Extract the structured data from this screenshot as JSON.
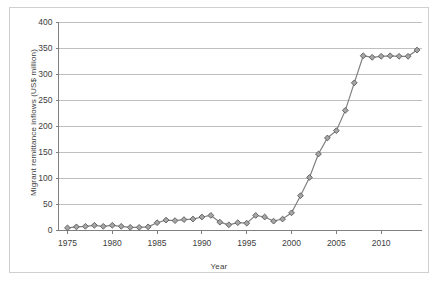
{
  "chart_data": {
    "type": "line",
    "title": "",
    "subtitle": "",
    "xlabel": "Year",
    "ylabel": "Migrant remittance inflows (US$ million)",
    "xlim": [
      1974,
      2014.5
    ],
    "ylim": [
      0,
      400
    ],
    "ytick_labels": [
      "0",
      "50",
      "100",
      "150",
      "200",
      "250",
      "300",
      "350",
      "400"
    ],
    "ytick_values": [
      0,
      50,
      100,
      150,
      200,
      250,
      300,
      350,
      400
    ],
    "xtick_labels": [
      "1975",
      "1980",
      "1985",
      "1990",
      "1995",
      "2000",
      "2005",
      "2010"
    ],
    "xtick_values": [
      1975,
      1980,
      1985,
      1990,
      1995,
      2000,
      2005,
      2010
    ],
    "grid": "horizontal",
    "legend": "none",
    "marker": "diamond",
    "series_color": "#808080",
    "marker_fill": "#a6a6a6",
    "marker_stroke": "#595959",
    "grid_color": "#bfbfbf",
    "axis_color": "#808080",
    "text_color": "#404040",
    "background": "#ffffff",
    "x": [
      1975,
      1976,
      1977,
      1978,
      1979,
      1980,
      1981,
      1982,
      1983,
      1984,
      1985,
      1986,
      1987,
      1988,
      1989,
      1990,
      1991,
      1992,
      1993,
      1994,
      1995,
      1996,
      1997,
      1998,
      1999,
      2000,
      2001,
      2002,
      2003,
      2004,
      2005,
      2006,
      2007,
      2008,
      2009,
      2010,
      2011,
      2012,
      2013,
      2014
    ],
    "values": [
      5,
      7,
      8,
      10,
      8,
      10,
      8,
      6,
      6,
      7,
      15,
      20,
      19,
      21,
      22,
      26,
      29,
      16,
      11,
      15,
      14,
      29,
      26,
      18,
      22,
      34,
      67,
      102,
      147,
      178,
      192,
      231,
      284,
      336,
      333,
      335,
      336,
      335,
      335,
      347
    ],
    "series": [
      {
        "name": "Migrant remittance inflows",
        "values": [
          5,
          7,
          8,
          10,
          8,
          10,
          8,
          6,
          6,
          7,
          15,
          20,
          19,
          21,
          22,
          26,
          29,
          16,
          11,
          15,
          14,
          29,
          26,
          18,
          22,
          34,
          67,
          102,
          147,
          178,
          192,
          231,
          284,
          336,
          333,
          335,
          336,
          335,
          335,
          347
        ]
      }
    ]
  }
}
